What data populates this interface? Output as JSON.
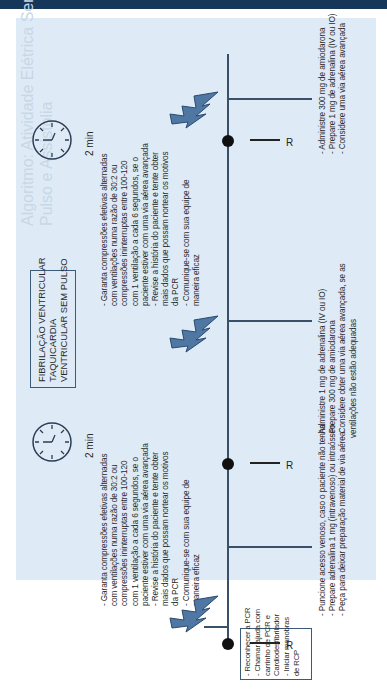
{
  "header_ghost": {
    "line1": "Algoritmo: Atividade Elétrica Sem",
    "line2": "Pulso e Assistolia"
  },
  "rhythm_box": {
    "lines": [
      "FIBRILAÇÃO VENTRICULAR",
      "TAQUICARDIA",
      "VENTRICULAR SEM PULSO"
    ]
  },
  "initial_box": {
    "lines": [
      "- Reconhecer a PCR",
      "- Chamar ajuda com",
      "  carrinho de PCR e",
      "  Cardiodesfibrilador",
      "- Iniciar manobras",
      "  de RCP"
    ]
  },
  "cycles": [
    {
      "duration": "2 min",
      "icon": "clock-icon",
      "shock_icon": "lightning-bolt-icon",
      "upper_text": [
        "- Garanta compressões efetivas alternadas",
        "  com ventilações numa razão de 30:2 ou",
        "  compressões ininterruptas entre 100-120",
        "  com 1 ventilação a cada 6 segundos, se o",
        "  paciente estiver com uma via aérea avançada",
        "- Revise a história do paciente e tente obter",
        "  mais dados que possam nortear os motivos",
        "  da PCR",
        "- Comunique-se com sua equipe de",
        "  maneira eficaz"
      ]
    },
    {
      "duration": "2 min",
      "icon": "clock-icon",
      "shock_icon": "lightning-bolt-icon",
      "upper_text": [
        "- Garanta compressões efetivas alternadas",
        "  com ventilações numa razão de 30:2 ou",
        "  compressões ininterruptas entre 100-120",
        "  com 1 ventilação a cada 6 segundos, se o",
        "  paciente estiver com uma via aérea avançada",
        "- Revise a história do paciente e tente obter",
        "  mais dados que possam nortear os motivos",
        "  da PCR",
        "- Comunique-se com sua equipe de",
        "  maneira eficaz"
      ]
    }
  ],
  "rhythm_checks": [
    {
      "label": "R"
    },
    {
      "label": "R"
    },
    {
      "label": "R"
    }
  ],
  "lower_text": [
    [
      "- Puncione acesso venoso, caso o paciente não tenha",
      "- Prepare adrenalina 1 mg (intravenoso) ou intraósseo",
      "- Peça para deixar preparação material de via aérea"
    ],
    [
      "- Administre 1 mg de adrenalina (IV ou IO)",
      "- Prepare 300 mg de amiodarona",
      "- Considere obter uma via aérea avançada, se as",
      "  ventilações não estão adequadas"
    ],
    [
      "- Administre 300 mg de amiodarona",
      "- Prepare 1 mg de adrenalina (IV ou IO)",
      "- Considere uma via aérea avançada"
    ]
  ],
  "colors": {
    "panel_bg": "#deebf6",
    "line": "#3a5068",
    "bolt_fill": "#4f77a3",
    "header_bar": "#16375a"
  }
}
